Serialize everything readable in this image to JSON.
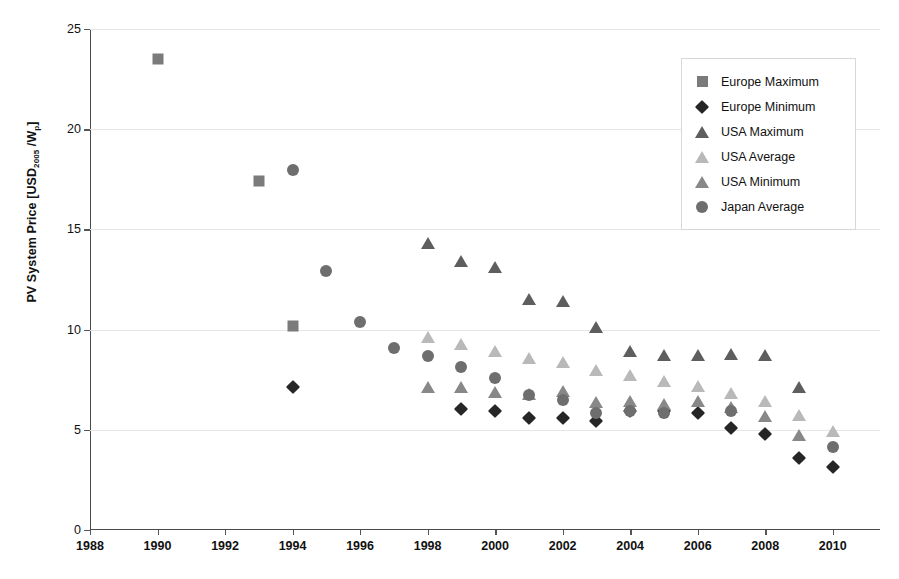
{
  "chart_data": {
    "type": "scatter",
    "title": "",
    "xlabel": "",
    "ylabel": "PV System Price [USD2005 /Wp]",
    "ylabel_parts": {
      "main": "PV System Price [USD",
      "sub1": "2005",
      "mid": " /W",
      "sub2": "p",
      "end": "]"
    },
    "xlim": [
      1988,
      2011.4
    ],
    "ylim": [
      0,
      25
    ],
    "xticks": [
      1988,
      1990,
      1992,
      1994,
      1996,
      1998,
      2000,
      2002,
      2004,
      2006,
      2008,
      2010
    ],
    "yticks": [
      0,
      5,
      10,
      15,
      20,
      25
    ],
    "grid": "horizontal",
    "legend_position": "top-right",
    "series": [
      {
        "name": "Europe Maximum",
        "marker": "square",
        "color": "#7b7b7b",
        "points": [
          {
            "x": 1990,
            "y": 23.5
          },
          {
            "x": 1993,
            "y": 17.4
          },
          {
            "x": 1994,
            "y": 10.2
          }
        ]
      },
      {
        "name": "Europe Minimum",
        "marker": "diamond",
        "color": "#262626",
        "points": [
          {
            "x": 1994,
            "y": 7.15
          },
          {
            "x": 1999,
            "y": 6.05
          },
          {
            "x": 2000,
            "y": 5.95
          },
          {
            "x": 2001,
            "y": 5.6
          },
          {
            "x": 2002,
            "y": 5.6
          },
          {
            "x": 2003,
            "y": 5.45
          },
          {
            "x": 2004,
            "y": 5.95
          },
          {
            "x": 2005,
            "y": 5.95
          },
          {
            "x": 2006,
            "y": 5.85
          },
          {
            "x": 2007,
            "y": 5.1
          },
          {
            "x": 2008,
            "y": 4.8
          },
          {
            "x": 2009,
            "y": 3.6
          },
          {
            "x": 2010,
            "y": 3.15
          }
        ]
      },
      {
        "name": "USA Maximum",
        "marker": "triangle",
        "color": "#5e5e5e",
        "points": [
          {
            "x": 1998,
            "y": 14.35
          },
          {
            "x": 1999,
            "y": 13.45
          },
          {
            "x": 2000,
            "y": 13.15
          },
          {
            "x": 2001,
            "y": 11.6
          },
          {
            "x": 2002,
            "y": 11.5
          },
          {
            "x": 2003,
            "y": 10.2
          },
          {
            "x": 2004,
            "y": 9.0
          },
          {
            "x": 2005,
            "y": 8.8
          },
          {
            "x": 2006,
            "y": 8.8
          },
          {
            "x": 2007,
            "y": 8.85
          },
          {
            "x": 2008,
            "y": 8.8
          },
          {
            "x": 2009,
            "y": 7.2
          }
        ]
      },
      {
        "name": "USA Average",
        "marker": "triangle",
        "color": "#b9b9b9",
        "points": [
          {
            "x": 1998,
            "y": 9.7
          },
          {
            "x": 1999,
            "y": 9.35
          },
          {
            "x": 2000,
            "y": 9.0
          },
          {
            "x": 2001,
            "y": 8.65
          },
          {
            "x": 2002,
            "y": 8.45
          },
          {
            "x": 2003,
            "y": 8.05
          },
          {
            "x": 2004,
            "y": 7.8
          },
          {
            "x": 2005,
            "y": 7.5
          },
          {
            "x": 2006,
            "y": 7.25
          },
          {
            "x": 2007,
            "y": 6.9
          },
          {
            "x": 2008,
            "y": 6.5
          },
          {
            "x": 2009,
            "y": 5.8
          },
          {
            "x": 2010,
            "y": 5.0
          }
        ]
      },
      {
        "name": "USA Minimum",
        "marker": "triangle",
        "color": "#888888",
        "points": [
          {
            "x": 1998,
            "y": 7.2
          },
          {
            "x": 1999,
            "y": 7.2
          },
          {
            "x": 2000,
            "y": 6.95
          },
          {
            "x": 2001,
            "y": 6.85
          },
          {
            "x": 2002,
            "y": 7.0
          },
          {
            "x": 2003,
            "y": 6.45
          },
          {
            "x": 2004,
            "y": 6.5
          },
          {
            "x": 2005,
            "y": 6.35
          },
          {
            "x": 2006,
            "y": 6.5
          },
          {
            "x": 2007,
            "y": 6.2
          },
          {
            "x": 2008,
            "y": 5.75
          },
          {
            "x": 2009,
            "y": 4.8
          }
        ]
      },
      {
        "name": "Japan Average",
        "marker": "circle",
        "color": "#6e6e6e",
        "points": [
          {
            "x": 1994,
            "y": 17.95
          },
          {
            "x": 1995,
            "y": 12.9
          },
          {
            "x": 1996,
            "y": 10.4
          },
          {
            "x": 1997,
            "y": 9.1
          },
          {
            "x": 1998,
            "y": 8.7
          },
          {
            "x": 1999,
            "y": 8.15
          },
          {
            "x": 2000,
            "y": 7.6
          },
          {
            "x": 2001,
            "y": 6.75
          },
          {
            "x": 2002,
            "y": 6.5
          },
          {
            "x": 2003,
            "y": 5.85
          },
          {
            "x": 2004,
            "y": 5.95
          },
          {
            "x": 2005,
            "y": 5.85
          },
          {
            "x": 2007,
            "y": 5.95
          },
          {
            "x": 2010,
            "y": 4.15
          }
        ]
      }
    ]
  },
  "legend": {
    "items": [
      {
        "label": "Europe Maximum",
        "marker": "square",
        "color": "#7b7b7b"
      },
      {
        "label": "Europe Minimum",
        "marker": "diamond",
        "color": "#262626"
      },
      {
        "label": "USA Maximum",
        "marker": "triangle",
        "color": "#5e5e5e"
      },
      {
        "label": "USA Average",
        "marker": "triangle",
        "color": "#b9b9b9"
      },
      {
        "label": "USA Minimum",
        "marker": "triangle",
        "color": "#888888"
      },
      {
        "label": "Japan Average",
        "marker": "circle",
        "color": "#6e6e6e"
      }
    ]
  }
}
